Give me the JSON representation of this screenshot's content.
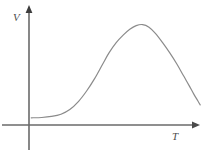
{
  "figure": {
    "width": 208,
    "height": 157,
    "background_color": "#ffffff",
    "axis_color": "#6a6a6a",
    "curve_color": "#8b8b8b",
    "label_color": "#4d4d4d"
  },
  "labels": {
    "y_axis": "V",
    "x_axis": "T"
  },
  "chart_data": {
    "type": "line",
    "title": "",
    "xlabel": "T",
    "ylabel": "V",
    "grid": false,
    "legend": null,
    "axis_arrows": {
      "x": "right",
      "y": "up"
    },
    "tick_labels": {
      "x": [],
      "y": []
    },
    "xlim": [
      0,
      1
    ],
    "ylim": [
      0,
      1
    ],
    "series": [
      {
        "name": "V vs T",
        "description": "asymmetric bell-shaped curve: flat low plateau, steep rise, rounded peak, near-linear decline",
        "points": [
          [
            0.014,
            0.07
          ],
          [
            0.08,
            0.073
          ],
          [
            0.14,
            0.083
          ],
          [
            0.2,
            0.105
          ],
          [
            0.255,
            0.15
          ],
          [
            0.31,
            0.23
          ],
          [
            0.36,
            0.33
          ],
          [
            0.41,
            0.45
          ],
          [
            0.46,
            0.59
          ],
          [
            0.5,
            0.7
          ],
          [
            0.545,
            0.8
          ],
          [
            0.59,
            0.875
          ],
          [
            0.63,
            0.93
          ],
          [
            0.67,
            0.965
          ],
          [
            0.71,
            0.975
          ],
          [
            0.75,
            0.95
          ],
          [
            0.79,
            0.89
          ],
          [
            0.835,
            0.8
          ],
          [
            0.88,
            0.7
          ],
          [
            0.925,
            0.59
          ],
          [
            0.965,
            0.48
          ],
          [
            1.0,
            0.385
          ],
          [
            1.03,
            0.3
          ],
          [
            1.055,
            0.235
          ],
          [
            1.07,
            0.195
          ]
        ]
      }
    ]
  }
}
